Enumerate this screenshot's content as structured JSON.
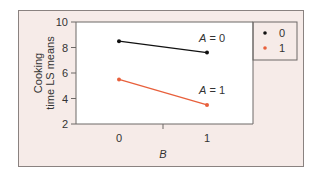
{
  "chart_data": {
    "type": "line",
    "title": "",
    "xlabel": "B",
    "ylabel": "Cooking time LS means",
    "ylabel_lines": [
      "Cooking",
      "time LS means"
    ],
    "x": [
      0,
      1
    ],
    "x_tick_labels": [
      "0",
      "1"
    ],
    "yticks": [
      2,
      4,
      6,
      8,
      10
    ],
    "y_tick_labels": [
      "2",
      "4",
      "6",
      "8",
      "10"
    ],
    "ylim": [
      2,
      10
    ],
    "grid": false,
    "legend_position": "right",
    "legend": [
      {
        "label": "0",
        "color": "#111111"
      },
      {
        "label": "1",
        "color": "#e8603c"
      }
    ],
    "series": [
      {
        "name": "0",
        "annotation": "A = 0",
        "color": "#111111",
        "values": [
          8.5,
          7.6
        ]
      },
      {
        "name": "1",
        "annotation": "A = 1",
        "color": "#e8603c",
        "values": [
          5.5,
          3.5
        ]
      }
    ]
  }
}
